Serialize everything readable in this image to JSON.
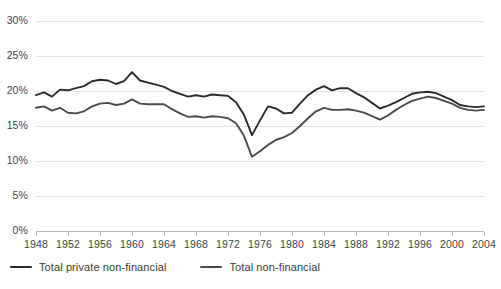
{
  "chart_data": {
    "type": "line",
    "title": "",
    "subtitle": "",
    "xlabel": "",
    "ylabel": "",
    "grid": true,
    "legend_position": "bottom-left",
    "xlim": [
      1948,
      2004
    ],
    "ylim": [
      0,
      30
    ],
    "y_ticks": [
      0,
      5,
      10,
      15,
      20,
      25,
      30
    ],
    "y_tick_labels": [
      "0%",
      "5%",
      "10%",
      "15%",
      "20%",
      "25%",
      "30%"
    ],
    "x_ticks": [
      1948,
      1952,
      1956,
      1960,
      1964,
      1968,
      1972,
      1976,
      1980,
      1984,
      1988,
      1992,
      1996,
      2000,
      2004
    ],
    "x_tick_labels": [
      "1948",
      "1952",
      "1956",
      "1960",
      "1964",
      "1968",
      "1972",
      "1976",
      "1980",
      "1984",
      "1988",
      "1992",
      "1996",
      "2000",
      "2004"
    ],
    "x": [
      1948,
      1949,
      1950,
      1951,
      1952,
      1953,
      1954,
      1955,
      1956,
      1957,
      1958,
      1959,
      1960,
      1961,
      1962,
      1963,
      1964,
      1965,
      1966,
      1967,
      1968,
      1969,
      1970,
      1971,
      1972,
      1973,
      1974,
      1975,
      1976,
      1977,
      1978,
      1979,
      1980,
      1981,
      1982,
      1983,
      1984,
      1985,
      1986,
      1987,
      1988,
      1989,
      1990,
      1991,
      1992,
      1993,
      1994,
      1995,
      1996,
      1997,
      1998,
      1999,
      2000,
      2001,
      2002,
      2003,
      2004
    ],
    "series": [
      {
        "name": "Total private non-financial",
        "color": "#2b2b2b",
        "values": [
          19.4,
          19.8,
          19.2,
          20.2,
          20.1,
          20.4,
          20.7,
          21.4,
          21.6,
          21.5,
          21.0,
          21.4,
          22.7,
          21.5,
          21.2,
          20.9,
          20.6,
          20.0,
          19.6,
          19.2,
          19.4,
          19.2,
          19.5,
          19.4,
          19.3,
          18.4,
          16.6,
          13.7,
          15.8,
          17.8,
          17.5,
          16.8,
          16.9,
          18.2,
          19.4,
          20.2,
          20.7,
          20.1,
          20.4,
          20.4,
          19.7,
          19.1,
          18.3,
          17.5,
          17.9,
          18.4,
          19.0,
          19.6,
          19.8,
          19.9,
          19.7,
          19.2,
          18.7,
          18.0,
          17.8,
          17.7,
          17.8
        ]
      },
      {
        "name": "Total non-financial",
        "color": "#4a4a4a",
        "values": [
          17.6,
          17.8,
          17.2,
          17.6,
          16.9,
          16.8,
          17.1,
          17.8,
          18.2,
          18.3,
          18.0,
          18.2,
          18.8,
          18.2,
          18.1,
          18.1,
          18.1,
          17.4,
          16.8,
          16.3,
          16.4,
          16.2,
          16.4,
          16.3,
          16.1,
          15.4,
          13.6,
          10.6,
          11.4,
          12.3,
          13.0,
          13.4,
          14.0,
          15.0,
          16.1,
          17.1,
          17.6,
          17.3,
          17.3,
          17.4,
          17.2,
          16.9,
          16.4,
          15.9,
          16.5,
          17.3,
          18.0,
          18.6,
          18.9,
          19.2,
          19.0,
          18.6,
          18.2,
          17.6,
          17.3,
          17.2,
          17.3
        ]
      }
    ]
  },
  "legend": {
    "items": [
      {
        "label": "Total private non-financial",
        "color": "#2b2b2b"
      },
      {
        "label": "Total non-financial",
        "color": "#4a4a4a"
      }
    ]
  },
  "colors": {
    "background": "#ffffff",
    "gridline": "#e2e2e2",
    "axis": "#bdbdbd",
    "text": "#444444"
  }
}
